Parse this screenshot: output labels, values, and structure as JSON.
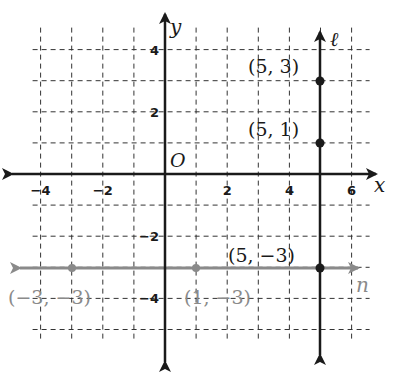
{
  "diagram": {
    "type": "coordinate-plane",
    "origin_label": "O",
    "x_axis_label": "x",
    "y_axis_label": "y",
    "x_ticks": [
      {
        "value": -4,
        "label": "−4"
      },
      {
        "value": -2,
        "label": "−2"
      },
      {
        "value": 2,
        "label": "2"
      },
      {
        "value": 4,
        "label": "4"
      },
      {
        "value": 6,
        "label": "6"
      }
    ],
    "y_ticks": [
      {
        "value": 4,
        "label": "4"
      },
      {
        "value": 2,
        "label": "2"
      },
      {
        "value": -2,
        "label": "−2"
      },
      {
        "value": -4,
        "label": "−4"
      }
    ],
    "grid": {
      "x_min": -4,
      "x_max": 6,
      "y_min": -5,
      "y_max": 4,
      "style": "dashed"
    },
    "lines": [
      {
        "name": "ℓ",
        "kind": "vertical",
        "equation": "x = 5",
        "color": "#1a1a1a"
      },
      {
        "name": "n",
        "kind": "horizontal",
        "equation": "y = −3",
        "color": "#8a8a8a"
      }
    ],
    "points": [
      {
        "x": 5,
        "y": 3,
        "label": "(5,  3)",
        "color": "#1a1a1a"
      },
      {
        "x": 5,
        "y": 1,
        "label": "(5,  1)",
        "color": "#1a1a1a"
      },
      {
        "x": 5,
        "y": -3,
        "label": "(5,  −3)",
        "color": "#1a1a1a"
      },
      {
        "x": -3,
        "y": -3,
        "label": "(−3, −3)",
        "color": "#8a8a8a"
      },
      {
        "x": 1,
        "y": -3,
        "label": "(1, −3)",
        "color": "#8a8a8a"
      }
    ]
  }
}
